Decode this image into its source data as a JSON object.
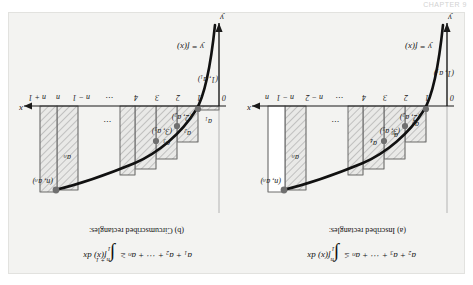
{
  "runhead": "CHAPTER 9",
  "figure": {
    "panels": [
      {
        "id": "a",
        "caption": "(a) Inscribed rectangles:",
        "formula": {
          "lhs": "a₂ + a₃ + ⋯ + aₙ",
          "relation": "≤",
          "integral_lower": "1",
          "integral_upper": "n",
          "integrand": "f(x) dx"
        },
        "curve_label": "y = f(x)",
        "y_axis_label": "y",
        "x_axis_label": "x",
        "x_ticks": [
          "0",
          "1",
          "2",
          "3",
          "4",
          "⋯",
          "n − 2",
          "n − 1",
          "n"
        ],
        "point_labels": [
          "(1, a₁)",
          "(2, a₂)",
          "(3, a₃)",
          "(n, aₙ)"
        ],
        "rect_labels": [
          "a₂",
          "a₃",
          "a₄",
          "aₙ"
        ],
        "ellipsis": "⋯"
      },
      {
        "id": "b",
        "caption": "(b) Circumscribed rectangles:",
        "formula": {
          "lhs": "a₁ + a₂ + ⋯ + aₙ",
          "relation": "≥",
          "integral_lower": "1",
          "integral_upper": "n + 1",
          "integrand": "f(x) dx"
        },
        "curve_label": "y = f(x)",
        "y_axis_label": "y",
        "x_axis_label": "x",
        "x_ticks": [
          "0",
          "1",
          "2",
          "3",
          "4",
          "⋯",
          "n − 1",
          "n",
          "n + 1"
        ],
        "point_labels": [
          "(1, a₁)",
          "(2, a₂)",
          "(3, a₃)",
          "(n, aₙ)"
        ],
        "rect_labels": [
          "a₁",
          "a₂",
          "a₃",
          "aₙ"
        ],
        "ellipsis": "⋯"
      }
    ],
    "colors": {
      "plate_background": "#f3f3f1",
      "page_background": "#ffffff",
      "ink": "#1a1a1a",
      "rect_fill": "#e8e8e6",
      "hatch": "#8d8d8d"
    }
  }
}
